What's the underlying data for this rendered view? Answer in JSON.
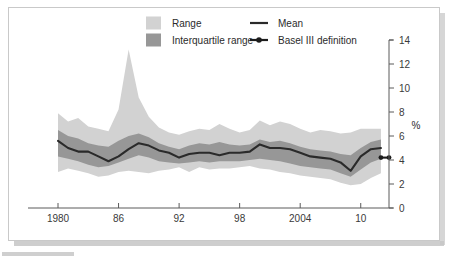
{
  "figure": {
    "unit_label": "%",
    "background_color": "#ffffff",
    "frame_color": "#c9c9c9"
  },
  "legend": {
    "items": [
      {
        "label": "Range",
        "type": "swatch",
        "color": "#d2d2d2"
      },
      {
        "label": "Interquartile range",
        "type": "swatch",
        "color": "#979797"
      },
      {
        "label": "Mean",
        "type": "line",
        "color": "#2a2a2a"
      },
      {
        "label": "Basel III definition",
        "type": "line-dot",
        "color": "#1c1c1c"
      }
    ]
  },
  "chart_data": {
    "type": "area",
    "title": "",
    "subtitle": "",
    "xlabel": "",
    "ylabel": "%",
    "xlim": [
      1980,
      2012.8
    ],
    "ylim": [
      0,
      14
    ],
    "ytick_step": 2,
    "grid": false,
    "legend_position": "top-center",
    "yticks": [
      0,
      2,
      4,
      6,
      8,
      10,
      12,
      14
    ],
    "xticks": [
      1980,
      1986,
      1992,
      1998,
      2004,
      2010
    ],
    "xtick_labels": [
      "1980",
      "86",
      "92",
      "98",
      "2004",
      "10"
    ],
    "x": [
      1980,
      1981,
      1982,
      1983,
      1984,
      1985,
      1986,
      1987,
      1988,
      1989,
      1990,
      1991,
      1992,
      1993,
      1994,
      1995,
      1996,
      1997,
      1998,
      1999,
      2000,
      2001,
      2002,
      2003,
      2004,
      2005,
      2006,
      2007,
      2008,
      2009,
      2010,
      2011,
      2012
    ],
    "series": [
      {
        "name": "Range",
        "type": "band",
        "color": "#d2d2d2",
        "upper": [
          7.9,
          7.2,
          7.5,
          6.8,
          6.6,
          6.4,
          8.2,
          13.2,
          9.2,
          7.6,
          6.7,
          6.3,
          6.1,
          6.4,
          6.6,
          6.5,
          7.0,
          6.6,
          6.3,
          6.5,
          7.3,
          6.9,
          7.2,
          7.0,
          6.6,
          6.3,
          6.5,
          6.4,
          6.2,
          6.3,
          6.6,
          6.6,
          6.6
        ],
        "lower": [
          3.0,
          3.3,
          3.1,
          2.9,
          2.6,
          2.7,
          3.0,
          3.1,
          3.0,
          2.9,
          3.1,
          3.2,
          3.4,
          3.0,
          3.4,
          3.2,
          3.3,
          3.3,
          3.4,
          3.5,
          3.3,
          3.2,
          3.0,
          2.9,
          2.7,
          2.6,
          2.5,
          2.4,
          2.1,
          1.9,
          2.0,
          2.5,
          2.9
        ]
      },
      {
        "name": "Interquartile range",
        "type": "band",
        "color": "#979797",
        "upper": [
          6.5,
          6.0,
          5.8,
          5.4,
          5.2,
          5.1,
          5.6,
          6.0,
          6.2,
          5.9,
          5.4,
          5.1,
          4.9,
          5.2,
          5.4,
          5.3,
          5.5,
          5.3,
          5.2,
          5.3,
          5.7,
          5.5,
          5.6,
          5.4,
          5.1,
          4.9,
          4.8,
          4.7,
          4.5,
          4.4,
          5.0,
          5.5,
          5.7
        ],
        "lower": [
          4.3,
          4.1,
          3.9,
          3.6,
          3.4,
          3.5,
          3.8,
          4.1,
          4.4,
          4.2,
          3.9,
          3.8,
          3.7,
          3.8,
          3.9,
          3.8,
          3.9,
          3.9,
          3.9,
          4.0,
          4.1,
          4.0,
          3.9,
          3.7,
          3.5,
          3.4,
          3.3,
          3.2,
          2.9,
          2.6,
          3.2,
          3.8,
          4.1
        ]
      },
      {
        "name": "Mean",
        "type": "line",
        "color": "#2a2a2a",
        "values": [
          5.6,
          5.0,
          4.7,
          4.7,
          4.3,
          3.9,
          4.3,
          4.9,
          5.4,
          5.2,
          4.8,
          4.6,
          4.2,
          4.5,
          4.6,
          4.6,
          4.4,
          4.6,
          4.6,
          4.7,
          5.3,
          5.0,
          5.0,
          4.9,
          4.6,
          4.3,
          4.2,
          4.1,
          3.8,
          3.1,
          4.3,
          4.9,
          5.0
        ]
      },
      {
        "name": "Basel III definition",
        "type": "line-dot",
        "color": "#1c1c1c",
        "x": [
          2012.0,
          2012.8
        ],
        "values": [
          4.2,
          4.2
        ]
      }
    ]
  }
}
